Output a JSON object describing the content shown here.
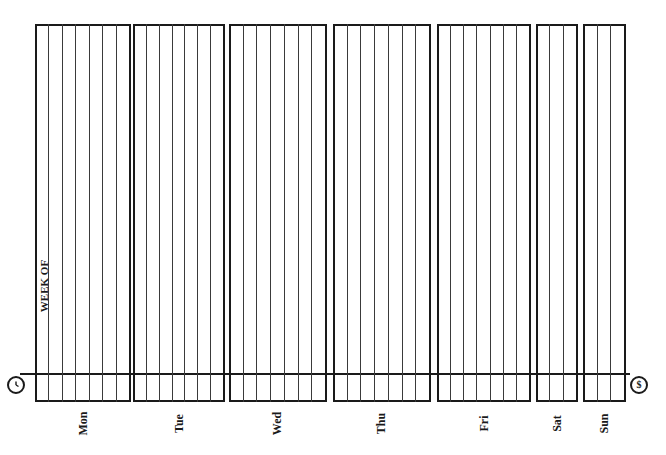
{
  "form": {
    "week_of_label": "WEEK OF",
    "left_icon": "clock-icon",
    "right_icon": "dollar-icon",
    "right_icon_glyph": "$",
    "line_color": "#1a1a1a"
  },
  "days": [
    {
      "label": "Mon",
      "left": 35,
      "width": 96,
      "lines": 7
    },
    {
      "label": "Tue",
      "left": 133,
      "width": 92,
      "lines": 7
    },
    {
      "label": "Wed",
      "left": 229,
      "width": 98,
      "lines": 7
    },
    {
      "label": "Thu",
      "left": 333,
      "width": 98,
      "lines": 7
    },
    {
      "label": "Fri",
      "left": 437,
      "width": 94,
      "lines": 7
    },
    {
      "label": "Sat",
      "left": 536,
      "width": 42,
      "lines": 3
    },
    {
      "label": "Sun",
      "left": 583,
      "width": 43,
      "lines": 3
    }
  ]
}
